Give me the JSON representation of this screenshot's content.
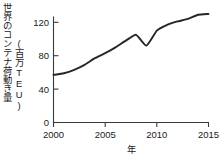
{
  "chart_data": {
    "type": "line",
    "title": "",
    "xlabel": "年",
    "ylabel": "世界のコンテナ荷動き量",
    "ylabel_unit": "(百万TEU)",
    "xlim": [
      2000,
      2015
    ],
    "ylim": [
      0,
      140
    ],
    "xticks": [
      2000,
      2005,
      2010,
      2015
    ],
    "xtick_labels": [
      "2000",
      "2005",
      "2010",
      "2015"
    ],
    "yticks": [
      0,
      40,
      80,
      120
    ],
    "ytick_labels": [
      "0",
      "40",
      "80",
      "120"
    ],
    "grid": false,
    "legend": "none",
    "x": [
      2000,
      2001,
      2002,
      2003,
      2004,
      2005,
      2006,
      2007,
      2008,
      2009,
      2010,
      2011,
      2012,
      2013,
      2014,
      2015
    ],
    "values": [
      57,
      59,
      63,
      69,
      77,
      83,
      90,
      98,
      105,
      92,
      110,
      117,
      121,
      124,
      129,
      130
    ],
    "series": [
      {
        "name": "世界のコンテナ荷動き量",
        "color": "#262626",
        "values": [
          57,
          59,
          63,
          69,
          77,
          83,
          90,
          98,
          105,
          92,
          110,
          117,
          121,
          124,
          129,
          130
        ]
      }
    ],
    "annotations": []
  },
  "axes": {
    "tick_color": "#3a3a3a",
    "line_color": "#262626"
  }
}
